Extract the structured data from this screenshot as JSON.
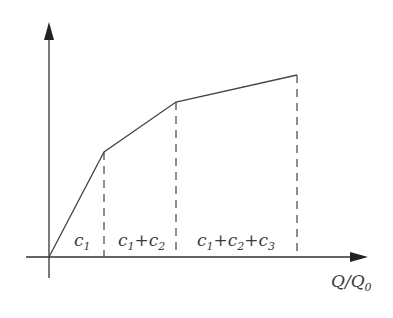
{
  "diagram": {
    "type": "piecewise-linear",
    "x_axis_label": {
      "main": "Q/Q",
      "sub": "0"
    },
    "y_axis_label": "",
    "origin": [
      49,
      257
    ],
    "points": [
      {
        "x": 49,
        "y": 257
      },
      {
        "x": 104,
        "y": 152
      },
      {
        "x": 176,
        "y": 102
      },
      {
        "x": 297,
        "y": 75
      }
    ],
    "segment_labels": [
      {
        "parts": [
          {
            "t": "c",
            "s": "1"
          }
        ],
        "x": 74
      },
      {
        "parts": [
          {
            "t": "c",
            "s": "1"
          },
          {
            "t": "+c",
            "s": "2"
          }
        ],
        "x": 118
      },
      {
        "parts": [
          {
            "t": "c",
            "s": "1"
          },
          {
            "t": "+c",
            "s": "2"
          },
          {
            "t": "+c",
            "s": "3"
          }
        ],
        "x": 197
      }
    ],
    "colors": {
      "line": "#444444",
      "axis": "#333333",
      "text": "#3a3a3a"
    }
  },
  "labels": {
    "seg1_c": "c",
    "seg1_s1": "1",
    "seg2_c1": "c",
    "seg2_s1": "1",
    "seg2_c2": "+c",
    "seg2_s2": "2",
    "seg3_c1": "c",
    "seg3_s1": "1",
    "seg3_c2": "+c",
    "seg3_s2": "2",
    "seg3_c3": "+c",
    "seg3_s3": "3",
    "xaxis_main": "Q/Q",
    "xaxis_sub": "0"
  }
}
